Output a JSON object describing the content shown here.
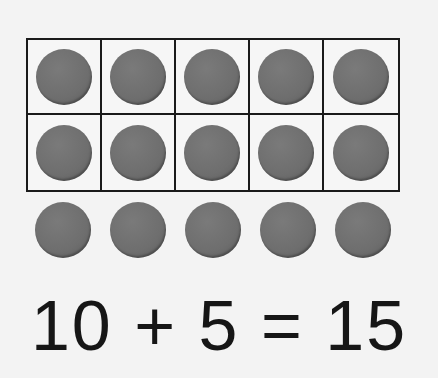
{
  "ten_frame": {
    "rows": 2,
    "columns": 5,
    "filled": [
      true,
      true,
      true,
      true,
      true,
      true,
      true,
      true,
      true,
      true
    ]
  },
  "extra_counters": {
    "count": 5
  },
  "equation": {
    "text": "10 + 5 = 15",
    "addend1": "10",
    "operator": "+",
    "addend2": "5",
    "equals": "=",
    "sum": "15"
  },
  "colors": {
    "counter": "#6f6f6f",
    "grid_line": "#1a1a1a",
    "background": "#f3f3f3",
    "text": "#161616"
  }
}
